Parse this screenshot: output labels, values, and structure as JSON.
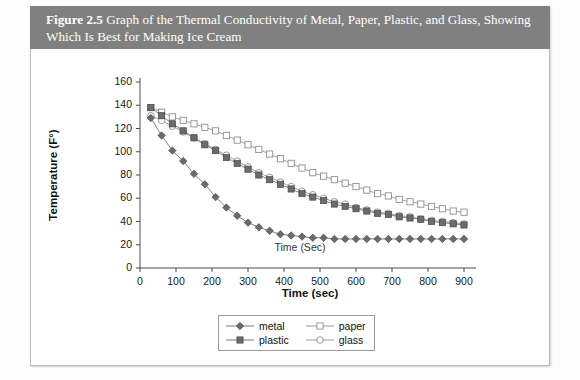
{
  "figure": {
    "number_label": "Figure 2.5",
    "caption": "Graph of the Thermal Conductivity of Metal, Paper, Plastic, and Glass, Showing Which Is Best for Making Ice Cream",
    "band_color": "#808080",
    "band_text_color": "#ffffff"
  },
  "chart_data": {
    "type": "line",
    "title": "Graph of the Thermal Conductivity of Metal, Paper, Plastic, and Glass, Showing Which Is Best for Making Ice Cream",
    "subtitle": "",
    "xlabel": "Time (sec)",
    "ylabel": "Temperature (F°)",
    "inner_annotation": "Time (Sec)",
    "xlim": [
      0,
      900
    ],
    "ylim": [
      0,
      160
    ],
    "xticks": [
      0,
      100,
      200,
      300,
      400,
      500,
      600,
      700,
      800,
      900
    ],
    "yticks": [
      0,
      20,
      40,
      60,
      80,
      100,
      120,
      140,
      160
    ],
    "grid": false,
    "legend_position": "bottom-center",
    "x": [
      30,
      60,
      90,
      120,
      150,
      180,
      210,
      240,
      270,
      300,
      330,
      360,
      390,
      420,
      450,
      480,
      510,
      540,
      570,
      600,
      630,
      660,
      690,
      720,
      750,
      780,
      810,
      840,
      870,
      900
    ],
    "series": [
      {
        "name": "metal",
        "marker": "filled-diamond",
        "color": "#6b6b6b",
        "values": [
          129,
          114,
          101,
          92,
          81,
          72,
          61,
          52,
          45,
          39,
          35,
          32,
          29,
          28,
          27,
          26,
          26,
          25,
          25,
          25,
          25,
          25,
          25,
          25,
          25,
          25,
          25,
          25,
          25,
          25
        ]
      },
      {
        "name": "plastic",
        "marker": "filled-square",
        "color": "#6b6b6b",
        "values": [
          138,
          131,
          124,
          118,
          112,
          106,
          101,
          95,
          90,
          85,
          80,
          76,
          72,
          68,
          64,
          61,
          58,
          55,
          53,
          51,
          49,
          47,
          46,
          44,
          43,
          42,
          40,
          39,
          38,
          37
        ]
      },
      {
        "name": "paper",
        "marker": "open-square",
        "color": "#8f8f8f",
        "values": [
          138,
          134,
          130,
          127,
          124,
          121,
          118,
          114,
          110,
          106,
          102,
          98,
          94,
          90,
          86,
          82,
          79,
          76,
          73,
          70,
          67,
          64,
          62,
          59,
          57,
          55,
          53,
          51,
          49,
          48
        ]
      },
      {
        "name": "glass",
        "marker": "open-circle",
        "color": "#8f8f8f",
        "values": [
          131,
          127,
          122,
          117,
          112,
          107,
          102,
          97,
          92,
          87,
          82,
          78,
          74,
          70,
          66,
          63,
          60,
          57,
          55,
          52,
          50,
          48,
          47,
          45,
          44,
          42,
          41,
          40,
          39,
          38
        ]
      }
    ],
    "legend": [
      {
        "label": "metal",
        "marker": "filled-diamond"
      },
      {
        "label": "paper",
        "marker": "open-square"
      },
      {
        "label": "plastic",
        "marker": "filled-square"
      },
      {
        "label": "glass",
        "marker": "open-circle"
      }
    ]
  }
}
